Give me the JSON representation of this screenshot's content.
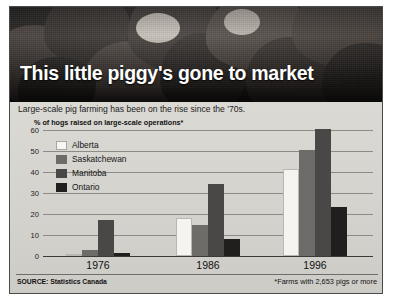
{
  "headline": "This little piggy's gone to market",
  "deck": "Large-scale pig farming has been on the rise since the '70s.",
  "axis_caption": "% of hogs raised on large-scale operations*",
  "source_note": "SOURCE: Statistics Canada",
  "footnote": "*Farms with 2,653 pigs or more",
  "photo": {
    "alt_name": "pigs-photograph",
    "description": "Herd of pigs packed together, black and white photograph"
  },
  "colors": {
    "alberta": "#f5f4f0",
    "saskatchewan": "#6e6c69",
    "manitoba": "#4a4846",
    "ontario": "#201f1e",
    "panel_background": "#d8d6d1",
    "gridline": "#8d8b86",
    "frame_border": "#4a4a4a"
  },
  "chart_data": {
    "type": "bar",
    "title": "This little piggy's gone to market",
    "subtitle": "Large-scale pig farming has been on the rise since the '70s.",
    "xlabel": "",
    "ylabel": "% of hogs raised on large-scale operations*",
    "ylim": [
      0,
      60
    ],
    "yticks": [
      0,
      10,
      20,
      30,
      40,
      50,
      60
    ],
    "ytick_labels": [
      "0",
      "10",
      "20",
      "30",
      "40",
      "50",
      "60"
    ],
    "grid": true,
    "legend_position": "inside-upper-left",
    "categories": [
      "1976",
      "1986",
      "1996"
    ],
    "series": [
      {
        "name": "Alberta",
        "values": [
          1,
          18,
          41
        ]
      },
      {
        "name": "Saskatchewan",
        "values": [
          3,
          14.5,
          50
        ]
      },
      {
        "name": "Manitoba",
        "values": [
          17,
          34,
          60
        ]
      },
      {
        "name": "Ontario",
        "values": [
          1.5,
          8,
          23
        ]
      }
    ],
    "annotations": [
      "*Farms with 2,653 pigs or more"
    ],
    "source": "SOURCE: Statistics Canada"
  }
}
